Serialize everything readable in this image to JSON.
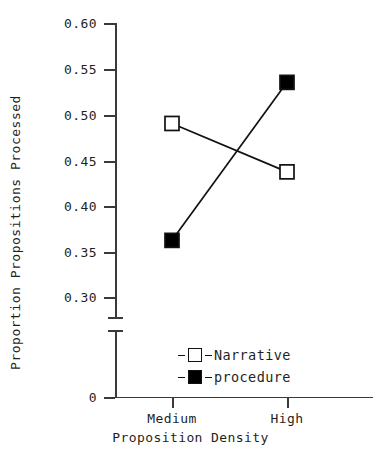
{
  "chart_data": {
    "type": "line",
    "title": "",
    "xlabel": "Proposition Density",
    "ylabel": "Proportion Propositions Processed",
    "categories": [
      "Medium",
      "High"
    ],
    "ylim": [
      0.3,
      0.6
    ],
    "ytick_labels": [
      "0.60",
      "0.55",
      "0.50",
      "0.45",
      "0.40",
      "0.35",
      "0.30",
      "0"
    ],
    "ytick_values": [
      0.6,
      0.55,
      0.5,
      0.45,
      0.4,
      0.35,
      0.3,
      0
    ],
    "axis_break": true,
    "grid": false,
    "legend_position": "inside-bottom-center",
    "series": [
      {
        "name": "Narrative",
        "marker": "open-square",
        "values": [
          0.49,
          0.437
        ]
      },
      {
        "name": "procedure",
        "marker": "filled-square",
        "values": [
          0.362,
          0.535
        ]
      }
    ]
  },
  "colors": {
    "line": "#111111",
    "axis": "#3a3a3a",
    "open_marker_fill": "#ffffff",
    "filled_marker_fill": "#000000",
    "background": "#ffffff"
  }
}
